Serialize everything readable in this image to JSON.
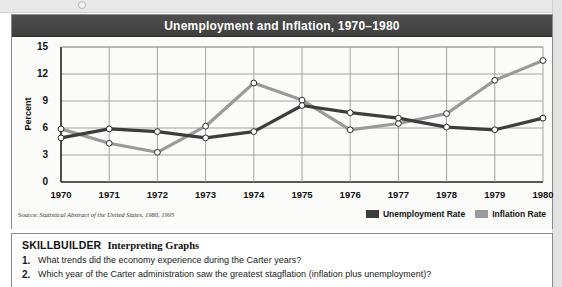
{
  "figure": {
    "title": "Unemployment and Inflation, 1970–1980",
    "source_prefix": "Source:",
    "source_text": "Statistical Abstract of the United States, 1980, 1995"
  },
  "colors": {
    "unemployment": "#3d3d3d",
    "inflation": "#9a9a9a",
    "title_bar": "#454545",
    "grid": "#9a9a9a",
    "axis": "#222222"
  },
  "chart_data": {
    "type": "line",
    "title": "Unemployment and Inflation, 1970–1980",
    "xlabel": "",
    "ylabel": "Percent",
    "categories": [
      "1970",
      "1971",
      "1972",
      "1973",
      "1974",
      "1975",
      "1976",
      "1977",
      "1978",
      "1979",
      "1980"
    ],
    "xticklabels": [
      "1970",
      "1971",
      "1972",
      "1973",
      "1974",
      "1975",
      "1976",
      "1977",
      "1978",
      "1979",
      "1980"
    ],
    "yticklabels": [
      "0",
      "3",
      "6",
      "9",
      "12",
      "15"
    ],
    "ylim": [
      0,
      15
    ],
    "ytick_step": 3,
    "grid": true,
    "legend_position": "bottom-right",
    "markers": "open-circle",
    "series": [
      {
        "name": "Unemployment Rate",
        "color": "#3d3d3d",
        "values": [
          4.9,
          5.9,
          5.6,
          4.9,
          5.6,
          8.5,
          7.7,
          7.1,
          6.1,
          5.8,
          7.1
        ]
      },
      {
        "name": "Inflation Rate",
        "color": "#9a9a9a",
        "values": [
          5.9,
          4.3,
          3.3,
          6.2,
          11.0,
          9.1,
          5.8,
          6.5,
          7.6,
          11.3,
          13.5
        ]
      }
    ]
  },
  "legend": [
    {
      "label": "Unemployment Rate",
      "color": "#3d3d3d"
    },
    {
      "label": "Inflation Rate",
      "color": "#9a9a9a"
    }
  ],
  "skillbuilder": {
    "heading": "SKILLBUILDER",
    "subheading": "Interpreting Graphs",
    "questions": [
      {
        "num": "1.",
        "text": "What trends did the economy experience during the Carter years?"
      },
      {
        "num": "2.",
        "text": "Which year of the Carter administration saw the greatest stagflation (inflation plus unemployment)?"
      }
    ]
  }
}
